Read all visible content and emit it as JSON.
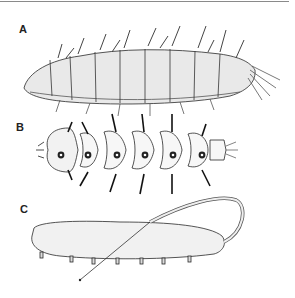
{
  "figure": {
    "panels": [
      {
        "label": "A",
        "description": "lateral view of spiny larva"
      },
      {
        "label": "B",
        "description": "dorsal view of segmented larva"
      },
      {
        "label": "C",
        "description": "rat-tailed larva with long breathing siphon"
      }
    ],
    "colors": {
      "ink": "#2a2a2a",
      "rule": "#8a8a8a",
      "background": "#ffffff"
    }
  }
}
